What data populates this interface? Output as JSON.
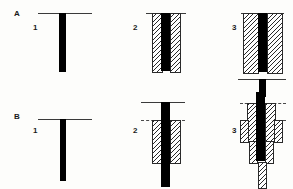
{
  "figure": {
    "background_color": "#fdfdfb",
    "bar_color": "#000000",
    "line_color": "#3a3a3a",
    "hatch_color": "#2a2a2a",
    "width_px": 293,
    "height_px": 189
  },
  "rows": [
    {
      "id": "A",
      "label": "A"
    },
    {
      "id": "B",
      "label": "B"
    }
  ],
  "steps": [
    {
      "number": "1"
    },
    {
      "number": "2"
    },
    {
      "number": "3"
    }
  ],
  "panels": {
    "a1": {
      "row_label": "A",
      "step_label": "1"
    },
    "a2": {
      "step_label": "2"
    },
    "a3": {
      "step_label": "3"
    },
    "b1": {
      "row_label": "B",
      "step_label": "1"
    },
    "b2": {
      "step_label": "2"
    },
    "b3": {
      "step_label": "3"
    }
  }
}
